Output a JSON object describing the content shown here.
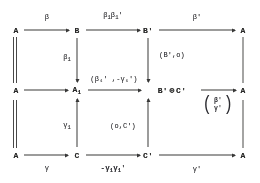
{
  "diagram": {
    "ink_color": "#3a3a3a",
    "background_color": "#fdfdfb",
    "nodes": {
      "r1c1": "A",
      "r1c2": "B",
      "r1c3": "B'",
      "r1c5": "A",
      "r2c1": "A",
      "r2c2_base": "A",
      "r2c2_sub": "1",
      "r2c3_left": "B'",
      "r2c3_oplus": "⊕",
      "r2c3_right": "C'",
      "r2c5": "A",
      "r3c1": "A",
      "r3c2": "C",
      "r3c3": "C'",
      "r3c5": "A"
    },
    "arrow_labels": {
      "top_left": "β",
      "top_middle_base1": "β",
      "top_middle_sub1": "1",
      "top_middle_base2": "β",
      "top_middle_sub2": "1",
      "top_middle_prime2": "'",
      "top_right": "β'",
      "vert_beta1_base": "β",
      "vert_beta1_sub": "1",
      "vert_Bo": "(B',o)",
      "mid_pair": "(β₁' ,-γ₁')",
      "vert_gamma1_base": "γ",
      "vert_gamma1_sub": "1",
      "vert_oC": "(o,C')",
      "bottom_left": "γ",
      "bottom_middle_base1": "-γ",
      "bottom_middle_sub1": "1",
      "bottom_middle_base2": "γ",
      "bottom_middle_sub2": "1",
      "bottom_middle_prime2": "'",
      "bottom_right": "γ'",
      "matrix_top": "β'",
      "matrix_bottom": "γ'",
      "matrix_open": "(",
      "matrix_close": ")"
    }
  }
}
